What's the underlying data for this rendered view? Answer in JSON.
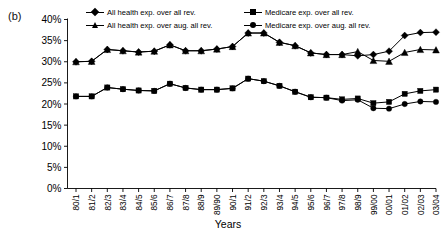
{
  "figure": {
    "panel_label": "(b)"
  },
  "legend": {
    "position": "top",
    "items": [
      {
        "label": "All health exp. over all rev.",
        "marker": "diamond",
        "column": 0,
        "row": 0
      },
      {
        "label": "All health exp. over aug. all rev.",
        "marker": "triangle",
        "column": 0,
        "row": 1
      },
      {
        "label": "Medicare exp. over all rev.",
        "marker": "square",
        "column": 1,
        "row": 0
      },
      {
        "label": "Medicare exp. over aug. all rev.",
        "marker": "circle",
        "column": 1,
        "row": 1
      }
    ]
  },
  "chart_data": {
    "type": "line",
    "title": "",
    "xlabel": "Years",
    "ylabel": "",
    "grid": false,
    "ylim": [
      0,
      40
    ],
    "ytick_values": [
      0,
      5,
      10,
      15,
      20,
      25,
      30,
      35,
      40
    ],
    "ytick_labels": [
      "0%",
      "5%",
      "10%",
      "15%",
      "20%",
      "25%",
      "30%",
      "35%",
      "40%"
    ],
    "categories": [
      "80/1",
      "81/2",
      "82/3",
      "83/4",
      "84/5",
      "85/6",
      "86/7",
      "87/8",
      "88/9",
      "89/90",
      "90/1",
      "91/2",
      "92/3",
      "93/4",
      "94/5",
      "95/6",
      "96/7",
      "97/8",
      "98/9",
      "99/00",
      "00/01",
      "01/02",
      "02/03",
      "03/04"
    ],
    "series": [
      {
        "name": "All health exp. over all rev.",
        "marker": "diamond",
        "values": [
          30.0,
          30.1,
          32.9,
          32.6,
          32.3,
          32.5,
          34.0,
          32.6,
          32.6,
          33.0,
          33.6,
          36.8,
          36.8,
          34.6,
          33.8,
          32.1,
          31.7,
          31.7,
          31.4,
          31.7,
          32.5,
          36.2,
          36.9,
          37.0
        ]
      },
      {
        "name": "All health exp. over aug. all rev.",
        "marker": "triangle",
        "values": [
          30.0,
          30.1,
          32.9,
          32.6,
          32.3,
          32.5,
          34.0,
          32.6,
          32.6,
          33.0,
          33.6,
          36.8,
          36.8,
          34.6,
          33.8,
          32.1,
          31.7,
          31.7,
          32.4,
          30.3,
          30.1,
          32.2,
          32.9,
          32.8
        ]
      },
      {
        "name": "Medicare exp. over all rev.",
        "marker": "square",
        "values": [
          21.8,
          21.8,
          23.9,
          23.5,
          23.2,
          23.1,
          24.8,
          23.8,
          23.4,
          23.4,
          23.7,
          26.0,
          25.4,
          24.3,
          22.9,
          21.6,
          21.5,
          21.1,
          21.3,
          20.2,
          20.5,
          22.4,
          23.1,
          23.4
        ]
      },
      {
        "name": "Medicare exp. over aug. all rev.",
        "marker": "circle",
        "values": [
          21.8,
          21.8,
          23.9,
          23.5,
          23.2,
          23.1,
          24.8,
          23.8,
          23.4,
          23.4,
          23.7,
          26.0,
          25.4,
          24.3,
          22.9,
          21.6,
          21.5,
          20.8,
          21.0,
          19.0,
          18.9,
          20.0,
          20.6,
          20.5
        ]
      }
    ]
  }
}
